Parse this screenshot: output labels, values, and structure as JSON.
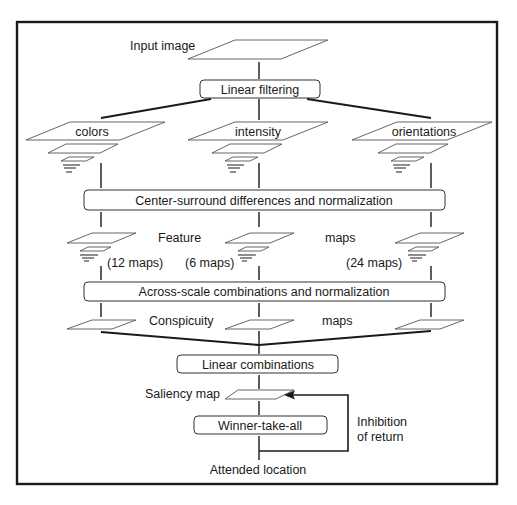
{
  "diagram": {
    "input": {
      "label": "Input image"
    },
    "stages": {
      "linear_filtering": "Linear filtering",
      "center_surround": "Center-surround differences and normalization",
      "across_scale": "Across-scale combinations and normalization",
      "linear_combinations": "Linear combinations",
      "winner_take_all": "Winner-take-all"
    },
    "channels": [
      {
        "name": "colors",
        "feature_maps": "(12 maps)"
      },
      {
        "name": "intensity",
        "feature_maps": "(6 maps)"
      },
      {
        "name": "orientations",
        "feature_maps": "(24 maps)"
      }
    ],
    "feature_maps_label": {
      "left": "Feature",
      "right": "maps"
    },
    "conspicuity_maps_label": {
      "left": "Conspicuity",
      "right": "maps"
    },
    "saliency_map": {
      "label": "Saliency map"
    },
    "feedback": {
      "line1": "Inhibition",
      "line2": "of return"
    },
    "output": {
      "label": "Attended location"
    }
  }
}
